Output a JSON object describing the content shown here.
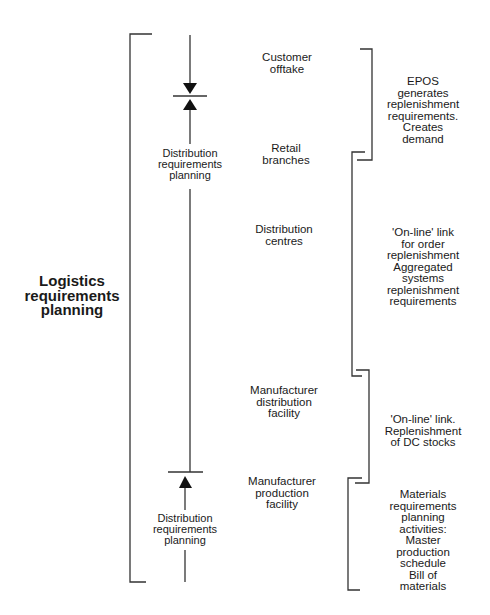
{
  "diagram": {
    "title": "Logistics requirements planning",
    "stages": [
      {
        "label": "Customer\nofftake"
      },
      {
        "label": "Retail\nbranches"
      },
      {
        "label": "Distribution\ncentres"
      },
      {
        "label": "Manufacturer\ndistribution\nfacility"
      },
      {
        "label": "Manufacturer\nproduction\nfacility"
      }
    ],
    "flow_labels": [
      {
        "label": "Distribution\nrequirements\nplanning",
        "position": "upper"
      },
      {
        "label": "Distribution\nrequirements\nplanning",
        "position": "lower"
      }
    ],
    "annotations": [
      {
        "label": "EPOS generates\nreplenishment\nrequirements.\nCreates demand"
      },
      {
        "label": "'On-line' link\nfor order\nreplenishment\nAggregated\nsystems\nreplenishment\nrequirements"
      },
      {
        "label": "'On-line' link.\nReplenishment\nof DC stocks"
      },
      {
        "label": "Materials\nrequirements\nplanning\nactivities:\nMaster\nproduction\nschedule\nBill of materials"
      }
    ],
    "line_color": "#333333"
  }
}
